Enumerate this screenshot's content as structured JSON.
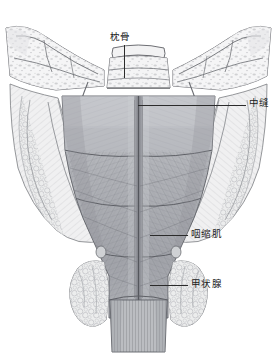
{
  "figure": {
    "view": "posterior",
    "background_color": "#ffffff",
    "line_color": "#2b2b2b",
    "label_color": "#1c1c1c",
    "width": 277,
    "height": 360
  },
  "labels": [
    {
      "id": "occipital-bone",
      "text": "枕骨",
      "x": 110,
      "y": 32,
      "leader": {
        "orientation": "vertical",
        "x": 124,
        "y": 45,
        "length": 33
      }
    },
    {
      "id": "median-raphe",
      "text": "中缝",
      "x": 249,
      "y": 98,
      "leader": {
        "orientation": "horizontal",
        "x": 138,
        "y": 105,
        "length": 108
      }
    },
    {
      "id": "pharyngeal-constrictor",
      "text": "咽缩肌",
      "x": 191,
      "y": 229,
      "leader": {
        "orientation": "horizontal",
        "x": 150,
        "y": 235,
        "length": 38
      }
    },
    {
      "id": "thyroid-gland",
      "text": "甲状腺",
      "x": 191,
      "y": 279,
      "leader": {
        "orientation": "horizontal",
        "x": 150,
        "y": 285,
        "length": 38
      }
    }
  ],
  "anatomy": {
    "structures": [
      {
        "name": "occipital-bone",
        "tone": "#e9e9ea"
      },
      {
        "name": "temporal-bone-left",
        "tone": "#ededee"
      },
      {
        "name": "temporal-bone-right",
        "tone": "#ededee"
      },
      {
        "name": "superior-pharyngeal-constrictor",
        "tone": "#b9bbbf"
      },
      {
        "name": "middle-pharyngeal-constrictor",
        "tone": "#a9abb0"
      },
      {
        "name": "inferior-pharyngeal-constrictor",
        "tone": "#9ea0a6"
      },
      {
        "name": "median-raphe",
        "tone": "#8e9096"
      },
      {
        "name": "thyroid-lobe-left",
        "tone": "#e2e3e5"
      },
      {
        "name": "thyroid-lobe-right",
        "tone": "#e2e3e5"
      },
      {
        "name": "esophagus",
        "tone": "#b4b6ba"
      },
      {
        "name": "styloid-process-left",
        "tone": "#d8d9db"
      },
      {
        "name": "styloid-process-right",
        "tone": "#d8d9db"
      }
    ]
  }
}
